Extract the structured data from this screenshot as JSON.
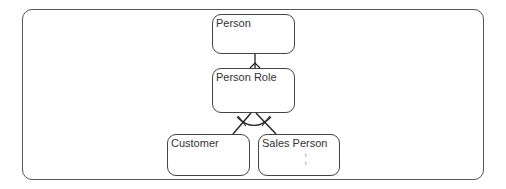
{
  "diagram": {
    "type": "entity-relationship",
    "entities": [
      {
        "id": "person",
        "label": "Person"
      },
      {
        "id": "person_role",
        "label": "Person Role"
      },
      {
        "id": "customer",
        "label": "Customer"
      },
      {
        "id": "sales_person",
        "label": "Sales Person"
      }
    ],
    "relationships": [
      {
        "from": "person",
        "to": "person_role",
        "type": "one-to-many"
      },
      {
        "from": "person_role",
        "to": "customer",
        "type": "subtype"
      },
      {
        "from": "person_role",
        "to": "sales_person",
        "type": "subtype"
      }
    ],
    "sales_person_marks": [
      "t",
      "t"
    ]
  }
}
